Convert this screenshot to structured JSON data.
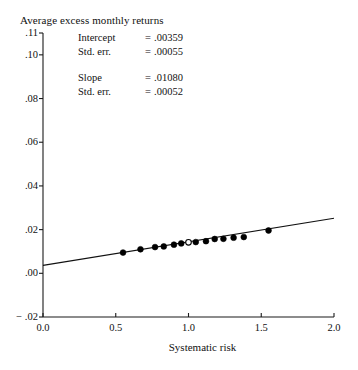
{
  "chart_data": {
    "type": "scatter",
    "title": "Average excess monthly returns",
    "xlabel": "Systematic risk",
    "ylabel": "",
    "xlim": [
      0.0,
      2.0
    ],
    "ylim": [
      -0.02,
      0.11
    ],
    "grid": false,
    "legend": "none",
    "xticks": [
      "0.0",
      "0.5",
      "1.0",
      "1.5",
      "2.0"
    ],
    "xtick_values": [
      0.0,
      0.5,
      1.0,
      1.5,
      2.0
    ],
    "yticks": [
      ".11",
      ".10",
      ".08",
      ".06",
      ".04",
      ".02",
      ".00",
      "− .02"
    ],
    "ytick_values": [
      0.11,
      0.1,
      0.08,
      0.06,
      0.04,
      0.02,
      0.0,
      -0.02
    ],
    "series": [
      {
        "name": "Portfolio excess returns",
        "marker": "filled-circle",
        "x": [
          0.55,
          0.67,
          0.77,
          0.83,
          0.9,
          0.95,
          1.05,
          1.12,
          1.18,
          1.24,
          1.31,
          1.38,
          1.55
        ],
        "y": [
          0.0095,
          0.011,
          0.012,
          0.0123,
          0.0131,
          0.0137,
          0.0143,
          0.0147,
          0.0157,
          0.0158,
          0.0163,
          0.0166,
          0.0196
        ]
      },
      {
        "name": "Market portfolio",
        "marker": "open-circle",
        "x": [
          1.0
        ],
        "y": [
          0.0142
        ]
      }
    ],
    "fit_line": {
      "name": "Fitted regression line",
      "intercept": 0.00359,
      "slope": 0.0108,
      "x_start": 0.0,
      "x_end": 2.0,
      "y_start": 0.00359,
      "y_end": 0.02519
    },
    "annotations": [
      {
        "key": "Intercept",
        "eq": "=",
        "value": ".00359"
      },
      {
        "key": "Std. err.",
        "eq": "=",
        "value": ".00055"
      },
      {
        "key": "Slope",
        "eq": "=",
        "value": ".01080"
      },
      {
        "key": "Std. err.",
        "eq": "=",
        "value": ".00052"
      }
    ],
    "colors": {
      "axis": "#1a1a1a",
      "line": "#111111",
      "marker_fill": "#000000",
      "marker_open_fill": "#ffffff",
      "background": "#ffffff"
    }
  }
}
